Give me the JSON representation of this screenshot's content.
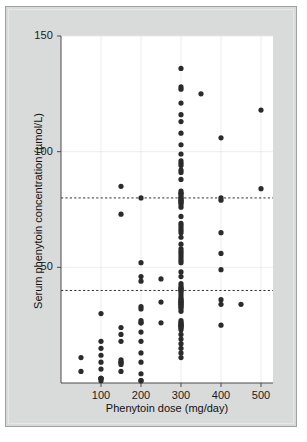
{
  "chart_data": {
    "type": "scatter",
    "title": "",
    "xlabel": "Phenytoin dose (mg/day)",
    "ylabel": "Serum phenytoin concentration (µmol/L)",
    "xlim": [
      0,
      530
    ],
    "ylim": [
      0,
      150
    ],
    "xticks": [
      100,
      200,
      300,
      400,
      500
    ],
    "xticklabels": [
      "100",
      "200",
      "300",
      "400",
      "500"
    ],
    "yticks": [
      50,
      100,
      150
    ],
    "yticklabels": [
      "50",
      "100",
      "150"
    ],
    "grid": true,
    "grid_color": "#e8e8e8",
    "legend": null,
    "marker_color": "#2b2b2b",
    "marker_size": 2.6,
    "reference_lines": [
      {
        "name": "upper-therapeutic-limit",
        "y": 80,
        "style": "dashed",
        "color": "#1b1b1b"
      },
      {
        "name": "lower-therapeutic-limit",
        "y": 40,
        "style": "dashed",
        "color": "#1b1b1b"
      }
    ],
    "points": [
      [
        50,
        11
      ],
      [
        50,
        5
      ],
      [
        100,
        30
      ],
      [
        100,
        18
      ],
      [
        100,
        15
      ],
      [
        100,
        12
      ],
      [
        100,
        9
      ],
      [
        100,
        6
      ],
      [
        100,
        2
      ],
      [
        100,
        2
      ],
      [
        100,
        2
      ],
      [
        100,
        1
      ],
      [
        150,
        85
      ],
      [
        150,
        73
      ],
      [
        150,
        24
      ],
      [
        150,
        21
      ],
      [
        150,
        18
      ],
      [
        150,
        10
      ],
      [
        150,
        9
      ],
      [
        150,
        9
      ],
      [
        150,
        8
      ],
      [
        150,
        5
      ],
      [
        200,
        80
      ],
      [
        200,
        52
      ],
      [
        200,
        46
      ],
      [
        200,
        44
      ],
      [
        200,
        33
      ],
      [
        200,
        32
      ],
      [
        200,
        27
      ],
      [
        200,
        26
      ],
      [
        200,
        26
      ],
      [
        200,
        22
      ],
      [
        200,
        18
      ],
      [
        200,
        13
      ],
      [
        200,
        9
      ],
      [
        200,
        4
      ],
      [
        200,
        1
      ],
      [
        200,
        1
      ],
      [
        250,
        45
      ],
      [
        250,
        35
      ],
      [
        250,
        26
      ],
      [
        300,
        136
      ],
      [
        300,
        128
      ],
      [
        300,
        127
      ],
      [
        300,
        121
      ],
      [
        300,
        116
      ],
      [
        300,
        113
      ],
      [
        300,
        108
      ],
      [
        300,
        103
      ],
      [
        300,
        99
      ],
      [
        300,
        96
      ],
      [
        300,
        95
      ],
      [
        300,
        94
      ],
      [
        300,
        92
      ],
      [
        300,
        91
      ],
      [
        300,
        88
      ],
      [
        300,
        83
      ],
      [
        300,
        82
      ],
      [
        300,
        82
      ],
      [
        300,
        81
      ],
      [
        300,
        80
      ],
      [
        300,
        80
      ],
      [
        300,
        79
      ],
      [
        300,
        79
      ],
      [
        300,
        78
      ],
      [
        300,
        78
      ],
      [
        300,
        77
      ],
      [
        300,
        76
      ],
      [
        300,
        72
      ],
      [
        300,
        69
      ],
      [
        300,
        68
      ],
      [
        300,
        67
      ],
      [
        300,
        66
      ],
      [
        300,
        65
      ],
      [
        300,
        63
      ],
      [
        300,
        60
      ],
      [
        300,
        58
      ],
      [
        300,
        57
      ],
      [
        300,
        56
      ],
      [
        300,
        55
      ],
      [
        300,
        54
      ],
      [
        300,
        53
      ],
      [
        300,
        52
      ],
      [
        300,
        48
      ],
      [
        300,
        46
      ],
      [
        300,
        43
      ],
      [
        300,
        42
      ],
      [
        300,
        41
      ],
      [
        300,
        41
      ],
      [
        300,
        40
      ],
      [
        300,
        40
      ],
      [
        300,
        39
      ],
      [
        300,
        38
      ],
      [
        300,
        37
      ],
      [
        300,
        36
      ],
      [
        300,
        36
      ],
      [
        300,
        35
      ],
      [
        300,
        35
      ],
      [
        300,
        35
      ],
      [
        300,
        34
      ],
      [
        300,
        34
      ],
      [
        300,
        33
      ],
      [
        300,
        33
      ],
      [
        300,
        32
      ],
      [
        300,
        31
      ],
      [
        300,
        27
      ],
      [
        300,
        26
      ],
      [
        300,
        26
      ],
      [
        300,
        25
      ],
      [
        300,
        25
      ],
      [
        300,
        25
      ],
      [
        300,
        24
      ],
      [
        300,
        24
      ],
      [
        300,
        23
      ],
      [
        300,
        21
      ],
      [
        300,
        19
      ],
      [
        300,
        17
      ],
      [
        300,
        15
      ],
      [
        300,
        13
      ],
      [
        300,
        11
      ],
      [
        350,
        125
      ],
      [
        400,
        106
      ],
      [
        400,
        80
      ],
      [
        400,
        79
      ],
      [
        400,
        65
      ],
      [
        400,
        56
      ],
      [
        400,
        49
      ],
      [
        400,
        36
      ],
      [
        400,
        34
      ],
      [
        400,
        25
      ],
      [
        450,
        34
      ],
      [
        500,
        118
      ],
      [
        500,
        84
      ]
    ]
  },
  "axes": {
    "x_tick_positions_px": [
      103.5,
      146,
      188.5,
      231,
      273
    ],
    "y_tick_positions_px": [
      257,
      146.5,
      36
    ]
  }
}
